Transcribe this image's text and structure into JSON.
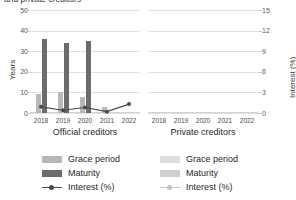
{
  "chart_title": "and private creditors",
  "chart_data": {
    "type": "bar",
    "title": "and private creditors",
    "categories": [
      "2018",
      "2019",
      "2020",
      "2021",
      "2022"
    ],
    "panels": [
      {
        "caption": "Official creditors",
        "series": [
          {
            "name": "Grace period",
            "unit": "Years",
            "values": [
              9,
              10,
              8,
              3,
              0
            ]
          },
          {
            "name": "Maturity",
            "unit": "Years",
            "values": [
              36,
              34,
              35,
              0,
              0
            ]
          },
          {
            "name": "Interest (%)",
            "unit": "Interest (%)",
            "values": [
              0.9,
              0.4,
              0.8,
              0.2,
              1.3
            ]
          }
        ]
      },
      {
        "caption": "Private creditors",
        "series": [
          {
            "name": "Grace period",
            "unit": "Years",
            "values": [
              0,
              0,
              0,
              0,
              0
            ]
          },
          {
            "name": "Maturity",
            "unit": "Years",
            "values": [
              0,
              0,
              0,
              0,
              0
            ]
          },
          {
            "name": "Interest (%)",
            "unit": "Interest (%)",
            "values": [
              0,
              0,
              0,
              0,
              0
            ]
          }
        ]
      }
    ],
    "yaxis_left": {
      "label": "Years",
      "ticks": [
        0,
        10,
        20,
        30,
        40,
        50
      ],
      "ylim": [
        0,
        50
      ]
    },
    "yaxis_right": {
      "label": "Interest (%)",
      "ticks": [
        0,
        3,
        6,
        9,
        12,
        15
      ],
      "ylim": [
        0,
        15
      ]
    },
    "xlabel": "",
    "grid": true,
    "legend_position": "bottom"
  },
  "colors": {
    "grace": "#b8b8b8",
    "maturity": "#6b6b6b",
    "interest": "#4a4a4a",
    "grace_faint": "#dedede",
    "maturity_faint": "#cfcfcf",
    "interest_faint": "#c4c4c4",
    "grid": "#e2e2e2"
  },
  "legends": [
    {
      "grace": "Grace period",
      "maturity": "Maturity",
      "interest": "Interest (%)"
    },
    {
      "grace": "Grace period",
      "maturity": "Maturity",
      "interest": "Interest (%)"
    }
  ]
}
